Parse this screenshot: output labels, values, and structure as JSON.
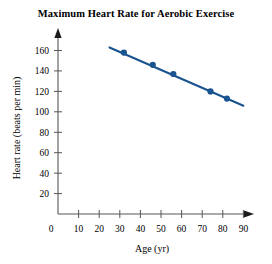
{
  "chart_data": {
    "type": "scatter",
    "title": "Maximum Heart Rate for Aerobic Exercise",
    "xlabel": "Age (yr)",
    "ylabel": "Heart rate (beats per min)",
    "xlim": [
      0,
      95
    ],
    "ylim": [
      0,
      172
    ],
    "xticks": [
      0,
      10,
      20,
      30,
      40,
      50,
      60,
      70,
      80,
      90
    ],
    "yticks": [
      20,
      40,
      60,
      80,
      100,
      120,
      140,
      160
    ],
    "grid": false,
    "legend": false,
    "series": [
      {
        "name": "Maximum heart rate",
        "x": [
          32,
          46,
          56,
          74,
          82
        ],
        "values": [
          158,
          146,
          137,
          120,
          113
        ],
        "marker": "circle",
        "color": "#1a5490"
      }
    ],
    "trend_line": {
      "name": "line of best fit",
      "x_start": 25,
      "y_start": 163,
      "x_end": 90,
      "y_end": 106,
      "color": "#1a5490"
    },
    "colors": {
      "data": "#1a5490",
      "axis": "#55565a",
      "text": "#000000",
      "background": "#ffffff"
    }
  },
  "axes": {
    "x_tick_labels": [
      "0",
      "10",
      "20",
      "30",
      "40",
      "50",
      "60",
      "70",
      "80",
      "90"
    ],
    "y_tick_labels": [
      "20",
      "40",
      "60",
      "80",
      "100",
      "120",
      "140",
      "160"
    ]
  }
}
